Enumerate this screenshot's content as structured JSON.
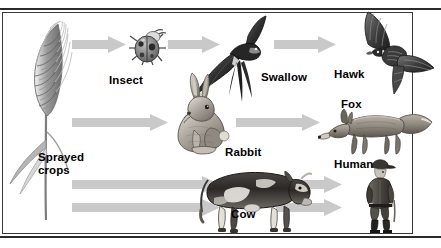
{
  "figure": {
    "type": "food-chain-diagram",
    "frame": {
      "border_color": "#3a3a3a",
      "background": "#ffffff"
    },
    "arrow_color": "#c9c9c9"
  },
  "labels": {
    "sprayed_crops": "Sprayed\ncrops",
    "insect": "Insect",
    "swallow": "Swallow",
    "hawk": "Hawk",
    "rabbit": "Rabbit",
    "fox": "Fox",
    "cow": "Cow",
    "human": "Human"
  },
  "organisms": [
    {
      "id": "sprayed-crops",
      "label": "Sprayed crops",
      "icon": "wheat-stalk-icon",
      "row": "source"
    },
    {
      "id": "insect",
      "label": "Insect",
      "icon": "ladybug-icon",
      "row": "top"
    },
    {
      "id": "swallow",
      "label": "Swallow",
      "icon": "swallow-bird-icon",
      "row": "top"
    },
    {
      "id": "hawk",
      "label": "Hawk",
      "icon": "hawk-bird-icon",
      "row": "top"
    },
    {
      "id": "rabbit",
      "label": "Rabbit",
      "icon": "rabbit-icon",
      "row": "middle"
    },
    {
      "id": "fox",
      "label": "Fox",
      "icon": "fox-icon",
      "row": "middle"
    },
    {
      "id": "cow",
      "label": "Cow",
      "icon": "cow-icon",
      "row": "bottom"
    },
    {
      "id": "human",
      "label": "Human",
      "icon": "human-figure-icon",
      "row": "bottom"
    }
  ],
  "chains": [
    {
      "name": "top",
      "sequence": [
        "Sprayed crops",
        "Insect",
        "Swallow",
        "Hawk"
      ]
    },
    {
      "name": "middle",
      "sequence": [
        "Sprayed crops",
        "Rabbit",
        "Fox"
      ]
    },
    {
      "name": "bottom",
      "sequence": [
        "Sprayed crops",
        "Cow",
        "Human"
      ]
    },
    {
      "name": "direct",
      "sequence": [
        "Sprayed crops",
        "Human"
      ]
    }
  ],
  "arrows": [
    {
      "id": "crops-to-insect",
      "from": "Sprayed crops",
      "to": "Insect"
    },
    {
      "id": "insect-to-swallow",
      "from": "Insect",
      "to": "Swallow"
    },
    {
      "id": "swallow-to-hawk",
      "from": "Swallow",
      "to": "Hawk"
    },
    {
      "id": "crops-to-rabbit",
      "from": "Sprayed crops",
      "to": "Rabbit"
    },
    {
      "id": "rabbit-to-fox",
      "from": "Rabbit",
      "to": "Fox"
    },
    {
      "id": "crops-to-cow",
      "from": "Sprayed crops",
      "to": "Cow"
    },
    {
      "id": "cow-to-human",
      "from": "Cow",
      "to": "Human"
    },
    {
      "id": "crops-to-human",
      "from": "Sprayed crops",
      "to": "Human"
    }
  ]
}
